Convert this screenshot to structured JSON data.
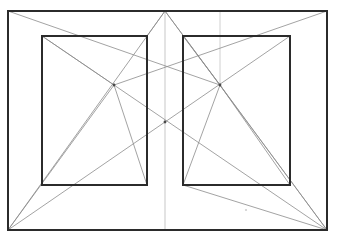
{
  "document": {
    "title": "Two-Point Perspective Construction Drawing",
    "kind": "line-drawing",
    "background_color": "#ffffff",
    "canvas": {
      "width": 339,
      "height": 247
    }
  },
  "colors": {
    "frame_stroke": "#2b2b2b",
    "construction_stroke": "#8c8c8c",
    "axis_stroke": "#b9b9b9",
    "faint_stroke": "#c4c4c4",
    "node_fill": "#4a4a4a",
    "speck_fill": "#cfcfcf"
  },
  "shapes": {
    "outer_frame": {
      "label": "outer-frame-rectangle",
      "x1": 8,
      "y1": 11,
      "x2": 327,
      "y2": 230,
      "stroke": "#2b2b2b",
      "stroke_width": 2
    },
    "left_panel": {
      "label": "left-inner-rectangle",
      "x1": 42,
      "y1": 36,
      "x2": 147,
      "y2": 185,
      "stroke": "#2b2b2b",
      "stroke_width": 2
    },
    "right_panel": {
      "label": "right-inner-rectangle",
      "x1": 183,
      "y1": 36,
      "x2": 290,
      "y2": 185,
      "stroke": "#2b2b2b",
      "stroke_width": 2
    }
  },
  "guides": {
    "center_vertical": {
      "label": "center-vertical-axis",
      "x": 165,
      "y1": 11,
      "y2": 230
    },
    "right_drop_vertical": {
      "label": "right-drop-vertical",
      "x": 220,
      "y1": 11,
      "y2": 86
    }
  },
  "nodes": [
    {
      "label": "left-vanishing-node",
      "x": 114,
      "y": 85
    },
    {
      "label": "right-vanishing-node",
      "x": 220,
      "y": 85
    },
    {
      "label": "center-crossing-node",
      "x": 165,
      "y": 122
    }
  ],
  "construction_lines": [
    {
      "label": "frame-diagonal-tl-to-center-node",
      "x1": 8,
      "y1": 11,
      "x2": 220,
      "y2": 85
    },
    {
      "label": "frame-diagonal-tr-to-left-node",
      "x1": 327,
      "y1": 11,
      "x2": 114,
      "y2": 85
    },
    {
      "label": "left-node-to-bottom-left",
      "x1": 114,
      "y1": 85,
      "x2": 8,
      "y2": 230
    },
    {
      "label": "right-node-to-bottom-right",
      "x1": 220,
      "y1": 85,
      "x2": 327,
      "y2": 230
    },
    {
      "label": "bottom-left-to-top-center",
      "x1": 8,
      "y1": 230,
      "x2": 165,
      "y2": 11
    },
    {
      "label": "bottom-right-to-top-center",
      "x1": 327,
      "y1": 230,
      "x2": 165,
      "y2": 11
    },
    {
      "label": "bottom-left-to-right-panel-corner",
      "x1": 8,
      "y1": 230,
      "x2": 290,
      "y2": 36
    },
    {
      "label": "bottom-right-to-left-panel-corner",
      "x1": 327,
      "y1": 230,
      "x2": 42,
      "y2": 36
    },
    {
      "label": "left-panel-tl-to-left-node",
      "x1": 42,
      "y1": 36,
      "x2": 114,
      "y2": 85
    },
    {
      "label": "left-node-to-left-panel-br",
      "x1": 114,
      "y1": 85,
      "x2": 147,
      "y2": 185
    },
    {
      "label": "right-panel-tl-to-right-node",
      "x1": 183,
      "y1": 36,
      "x2": 220,
      "y2": 85
    },
    {
      "label": "right-node-to-right-panel-bl",
      "x1": 220,
      "y1": 85,
      "x2": 183,
      "y2": 185
    },
    {
      "label": "right-node-to-right-panel-br",
      "x1": 220,
      "y1": 85,
      "x2": 290,
      "y2": 185
    },
    {
      "label": "top-center-to-right-node",
      "x1": 165,
      "y1": 11,
      "x2": 220,
      "y2": 85
    },
    {
      "label": "top-center-to-left-panel-tr",
      "x1": 165,
      "y1": 11,
      "x2": 147,
      "y2": 36
    },
    {
      "label": "right-panel-bl-to-bottom-right",
      "x1": 183,
      "y1": 185,
      "x2": 327,
      "y2": 230
    }
  ],
  "specks": [
    {
      "label": "paper-speck",
      "x": 246,
      "y": 210,
      "r": 1.1
    }
  ]
}
